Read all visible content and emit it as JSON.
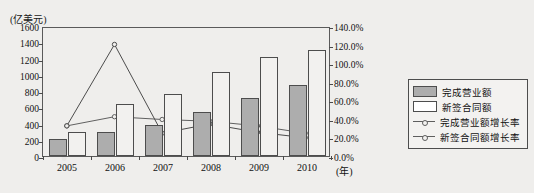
{
  "chart_data": {
    "type": "bar",
    "title": "",
    "ylabel": "(亿美元)",
    "xlabel": "(年)",
    "categories": [
      "2005",
      "2006",
      "2007",
      "2008",
      "2009",
      "2010"
    ],
    "ylim": [
      0,
      1600
    ],
    "y2lim": [
      0,
      1.4
    ],
    "yticks": [
      "0",
      "200",
      "400",
      "600",
      "800",
      "1000",
      "1200",
      "1400",
      "1600"
    ],
    "ytick_values": [
      0,
      200,
      400,
      600,
      800,
      1000,
      1200,
      1400,
      1600
    ],
    "y2ticks": [
      "0.0%",
      "20.0%",
      "40.0%",
      "60.0%",
      "80.0%",
      "100.0%",
      "120.0%",
      "140.0%"
    ],
    "y2tick_values": [
      0,
      0.2,
      0.4,
      0.6,
      0.8,
      1.0,
      1.2,
      1.4
    ],
    "grid": false,
    "legend_position": "right",
    "series": [
      {
        "name": "完成营业额",
        "kind": "bar",
        "axis": "left",
        "color": "#adadad",
        "values": [
          215,
          290,
          385,
          540,
          710,
          880
        ]
      },
      {
        "name": "新签合同额",
        "kind": "bar",
        "axis": "left",
        "color": "#f2f1ef",
        "values": [
          290,
          645,
          765,
          1030,
          1215,
          1300
        ]
      },
      {
        "name": "完成营业额增长率",
        "kind": "line",
        "axis": "right",
        "color": "#5e5e5e",
        "values": [
          0.33,
          0.43,
          0.4,
          0.38,
          0.33,
          0.25
        ]
      },
      {
        "name": "新签合同额增长率",
        "kind": "line",
        "axis": "right",
        "color": "#4a4a4a",
        "values": [
          0.33,
          1.22,
          0.25,
          0.35,
          0.26,
          0.2
        ]
      }
    ]
  },
  "legend": {
    "items": [
      {
        "label": "完成营业额",
        "marker": "swatch-filled"
      },
      {
        "label": "新签合同额",
        "marker": "swatch-hollow"
      },
      {
        "label": "完成营业额增长率",
        "marker": "line-marker"
      },
      {
        "label": "新签合同额增长率",
        "marker": "line-marker"
      }
    ]
  }
}
